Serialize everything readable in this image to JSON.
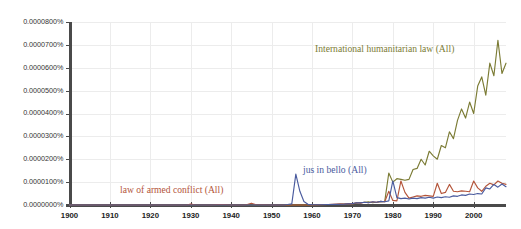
{
  "chart_data": {
    "type": "line",
    "title": "",
    "subtitle": "",
    "xlabel": "",
    "ylabel": "",
    "xlim": [
      1900,
      2008
    ],
    "ylim": [
      0.0,
      8e-05
    ],
    "grid": true,
    "legend_position": "inline-annotations",
    "xticks": [
      1900,
      1910,
      1920,
      1930,
      1940,
      1950,
      1960,
      1970,
      1980,
      1990,
      2000
    ],
    "xtick_labels": [
      "1900",
      "1910",
      "1920",
      "1930",
      "1940",
      "1950",
      "1960",
      "1970",
      "1980",
      "1990",
      "2000"
    ],
    "yticks": [
      0.0,
      1e-05,
      2e-05,
      3e-05,
      4e-05,
      5e-05,
      6e-05,
      7e-05,
      8e-05
    ],
    "ytick_labels": [
      "0.0000000%",
      "0.0000100%",
      "0.0000200%",
      "0.0000300%",
      "0.0000400%",
      "0.0000500%",
      "0.0000600%",
      "0.0000700%",
      "0.0000800%"
    ],
    "annotations": [
      {
        "text": "International humanitarian law (All)",
        "series": "International humanitarian law (All)",
        "color": "#7b7b34",
        "x_px": 315,
        "y_px": 50
      },
      {
        "text": "jus in bello (All)",
        "series": "jus in bello (All)",
        "color": "#4a5b9e",
        "x_px": 303,
        "y_px": 171
      },
      {
        "text": "law of armed conflict (All)",
        "series": "law of armed conflict (All)",
        "color": "#b4553a",
        "x_px": 120,
        "y_px": 191
      }
    ],
    "series": [
      {
        "name": "International humanitarian law (All)",
        "color": "#7b7b34",
        "x": [
          1900,
          1905,
          1910,
          1915,
          1920,
          1925,
          1930,
          1935,
          1940,
          1945,
          1950,
          1955,
          1960,
          1962,
          1964,
          1966,
          1967,
          1968,
          1969,
          1970,
          1971,
          1972,
          1973,
          1974,
          1975,
          1976,
          1977,
          1978,
          1979,
          1980,
          1981,
          1982,
          1983,
          1984,
          1985,
          1986,
          1987,
          1988,
          1989,
          1990,
          1991,
          1992,
          1993,
          1994,
          1995,
          1996,
          1997,
          1998,
          1999,
          2000,
          2001,
          2002,
          2003,
          2004,
          2005,
          2006,
          2007,
          2008
        ],
        "values": [
          0,
          0,
          0,
          0,
          0,
          0,
          0,
          0,
          0,
          0,
          0,
          0,
          0,
          1e-07,
          2e-07,
          2e-07,
          3e-07,
          4e-07,
          4e-07,
          5e-07,
          8e-07,
          1e-06,
          1.2e-06,
          1.4e-06,
          1e-06,
          1.2e-06,
          1.5e-06,
          1.6e-06,
          1.4e-05,
          1e-05,
          1.15e-05,
          1.12e-05,
          1.08e-05,
          1.12e-05,
          1.55e-05,
          1.6e-05,
          2e-05,
          1.75e-05,
          2.35e-05,
          2.15e-05,
          2e-05,
          2.6e-05,
          2.5e-05,
          3.2e-05,
          2.9e-05,
          3.7e-05,
          4.2e-05,
          3.8e-05,
          4.5e-05,
          4e-05,
          5.2e-05,
          5.6e-05,
          4.8e-05,
          6.2e-05,
          5.65e-05,
          7.2e-05,
          5.75e-05,
          6.2e-05
        ]
      },
      {
        "name": "law of armed conflict (All)",
        "color": "#b4553a",
        "x": [
          1900,
          1910,
          1920,
          1925,
          1929,
          1930,
          1931,
          1935,
          1937,
          1938,
          1940,
          1943,
          1944,
          1945,
          1946,
          1950,
          1955,
          1960,
          1964,
          1966,
          1967,
          1968,
          1969,
          1970,
          1971,
          1972,
          1973,
          1974,
          1975,
          1976,
          1977,
          1978,
          1979,
          1980,
          1981,
          1982,
          1983,
          1984,
          1985,
          1986,
          1987,
          1988,
          1989,
          1990,
          1991,
          1992,
          1993,
          1994,
          1995,
          1996,
          1997,
          1998,
          1999,
          2000,
          2001,
          2002,
          2003,
          2004,
          2005,
          2006,
          2007,
          2008
        ],
        "values": [
          0,
          0,
          0,
          0,
          0,
          4e-07,
          1e-07,
          0,
          2e-07,
          2e-07,
          0,
          0,
          2e-07,
          8e-07,
          2e-07,
          0,
          0,
          0,
          2e-07,
          4e-07,
          5e-07,
          4e-07,
          6e-07,
          5e-07,
          1e-06,
          8e-07,
          1.2e-06,
          1e-06,
          1.4e-06,
          1.2e-06,
          1.6e-06,
          1.4e-06,
          6e-06,
          2e-06,
          1.8e-06,
          1.05e-05,
          5.5e-06,
          3e-06,
          3.5e-06,
          4e-06,
          3.8e-06,
          4.2e-06,
          4e-06,
          3.8e-06,
          9.5e-06,
          5e-06,
          5.5e-06,
          9e-06,
          6e-06,
          5.8e-06,
          6.2e-06,
          6e-06,
          5.8e-06,
          1.05e-05,
          7.5e-06,
          6e-06,
          8.2e-06,
          9.5e-06,
          8.8e-06,
          1.05e-05,
          9.5e-06,
          9e-06
        ]
      },
      {
        "name": "jus in bello (All)",
        "color": "#4a5b9e",
        "x": [
          1900,
          1910,
          1920,
          1930,
          1940,
          1950,
          1953,
          1954,
          1955,
          1956,
          1957,
          1958,
          1959,
          1960,
          1962,
          1964,
          1966,
          1968,
          1969,
          1970,
          1971,
          1972,
          1973,
          1974,
          1975,
          1976,
          1977,
          1978,
          1979,
          1980,
          1981,
          1982,
          1983,
          1984,
          1985,
          1986,
          1987,
          1988,
          1989,
          1990,
          1991,
          1992,
          1993,
          1994,
          1995,
          1996,
          1997,
          1998,
          1999,
          2000,
          2001,
          2002,
          2003,
          2004,
          2005,
          2006,
          2007,
          2008
        ],
        "values": [
          0,
          0,
          0,
          0,
          0,
          0,
          0,
          2e-07,
          5e-07,
          1.35e-05,
          6e-06,
          1.5e-06,
          3e-07,
          1e-07,
          1e-07,
          2e-07,
          3e-07,
          4e-07,
          5e-07,
          6e-07,
          1e-06,
          9e-07,
          1.2e-06,
          1e-06,
          1.4e-06,
          1.2e-06,
          1.6e-06,
          1.4e-06,
          1.8e-06,
          1.05e-05,
          3.2e-06,
          2.8e-06,
          3e-06,
          2.6e-06,
          3e-06,
          2.8e-06,
          3.2e-06,
          3e-06,
          3.4e-06,
          3e-06,
          3.5e-06,
          3.2e-06,
          3.6e-06,
          3.4e-06,
          4e-06,
          3.8e-06,
          4.4e-06,
          4.2e-06,
          4.8e-06,
          4.6e-06,
          5e-06,
          4.8e-06,
          7.5e-06,
          7e-06,
          9e-06,
          7.8e-06,
          9.2e-06,
          8e-06
        ]
      }
    ]
  }
}
